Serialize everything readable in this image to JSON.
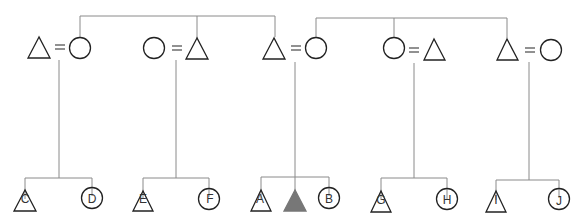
{
  "diagram": {
    "type": "kinship",
    "colors": {
      "line": "#8a8a8a",
      "shape_stroke": "#222222",
      "ego_fill": "#777777",
      "background": "#ffffff"
    },
    "sibling_groups_top": [
      {
        "y": 16,
        "x_from": 80,
        "x_to": 275,
        "drops_to": [
          "couple-1-wife",
          "couple-2-husband",
          "couple-3-husband"
        ]
      },
      {
        "y": 18,
        "x_from": 316,
        "x_to": 507,
        "drops_to": [
          "couple-3-wife",
          "couple-4-wife",
          "couple-5-husband"
        ]
      }
    ],
    "couples": [
      {
        "id": "couple-1",
        "left": {
          "shape": "triangle",
          "x": 39
        },
        "right": {
          "shape": "circle",
          "x": 80
        },
        "equals_x": 60,
        "descent_x": 59
      },
      {
        "id": "couple-2",
        "left": {
          "shape": "circle",
          "x": 154
        },
        "right": {
          "shape": "triangle",
          "x": 197
        },
        "equals_x": 177,
        "descent_x": 176
      },
      {
        "id": "couple-3",
        "left": {
          "shape": "triangle",
          "x": 274
        },
        "right": {
          "shape": "circle",
          "x": 316
        },
        "equals_x": 296,
        "descent_x": 295
      },
      {
        "id": "couple-4",
        "left": {
          "shape": "circle",
          "x": 394
        },
        "right": {
          "shape": "triangle",
          "x": 434
        },
        "equals_x": 414,
        "descent_x": 414
      },
      {
        "id": "couple-5",
        "left": {
          "shape": "triangle",
          "x": 507
        },
        "right": {
          "shape": "circle",
          "x": 551
        },
        "equals_x": 530,
        "descent_x": 529
      }
    ],
    "children_groups": [
      {
        "parent": "couple-1",
        "children": [
          {
            "label": "C",
            "shape": "triangle",
            "x": 25
          },
          {
            "label": "D",
            "shape": "circle",
            "x": 92
          }
        ]
      },
      {
        "parent": "couple-2",
        "children": [
          {
            "label": "E",
            "shape": "triangle",
            "x": 143
          },
          {
            "label": "F",
            "shape": "circle",
            "x": 209
          }
        ]
      },
      {
        "parent": "couple-3",
        "children": [
          {
            "label": "A",
            "shape": "triangle",
            "x": 261
          },
          {
            "label": "",
            "shape": "triangle-filled",
            "x": 295,
            "ego": true
          },
          {
            "label": "B",
            "shape": "circle",
            "x": 329
          }
        ]
      },
      {
        "parent": "couple-4",
        "children": [
          {
            "label": "G",
            "shape": "triangle",
            "x": 381
          },
          {
            "label": "H",
            "shape": "circle",
            "x": 447
          }
        ]
      },
      {
        "parent": "couple-5",
        "children": [
          {
            "label": "I",
            "shape": "triangle",
            "x": 496
          },
          {
            "label": "J",
            "shape": "circle",
            "x": 559
          }
        ]
      }
    ],
    "labels": {
      "C": "C",
      "D": "D",
      "E": "E",
      "F": "F",
      "A": "A",
      "B": "B",
      "G": "G",
      "H": "H",
      "I": "I",
      "J": "J"
    },
    "icons": {
      "male": "triangle-icon",
      "female": "circle-icon",
      "ego": "filled-triangle-icon",
      "marriage": "equals-icon"
    }
  }
}
